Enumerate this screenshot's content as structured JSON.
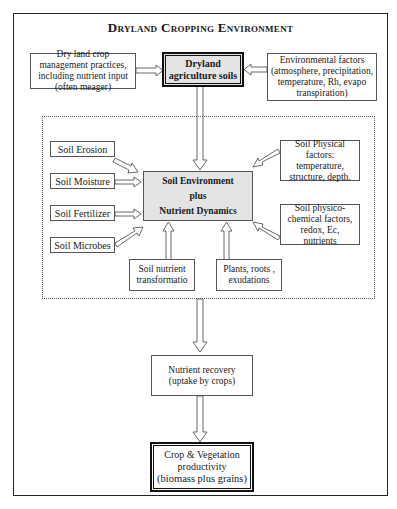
{
  "title": "Dryland Cropping Environment",
  "top_row": {
    "left": "Dry land crop management practices, including nutrient input (often meager)",
    "center_line1": "Dryland",
    "center_line2": "agriculture soils",
    "right": "Environmental factors (atmosphere, precipitation, temperature, Rh, evapo transpiration)"
  },
  "center": {
    "line1": "Soil Environment",
    "line2": "plus",
    "line3": "Nutrient Dynamics"
  },
  "left_factors": [
    "Soil Erosion",
    "Soil Moisture",
    "Soil Fertilizer",
    "Soil Microbes"
  ],
  "right_factors": {
    "physical": "Soil Physical factors: temperature, structure, depth.",
    "chemical": "Soil physico-chemical factors, redox, Ec, nutrients"
  },
  "bottom_factors": {
    "transformation": "Soil nutrient transformatio",
    "plants": "Plants, roots , exudations"
  },
  "recovery": "Nutrient recovery (uptake by crops)",
  "output": {
    "line1": "Crop & Vegetation",
    "line2": "productivity",
    "line3": "(biomass plus grains)"
  }
}
